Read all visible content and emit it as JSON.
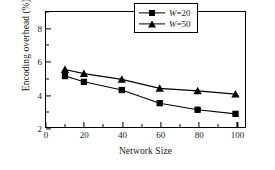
{
  "chart_data": {
    "type": "line",
    "title": "",
    "xlabel": "Network Size",
    "ylabel": "Encoding overhead (%)",
    "xlim": [
      0,
      105
    ],
    "ylim": [
      2,
      9
    ],
    "xticks": [
      0,
      20,
      40,
      60,
      80,
      100
    ],
    "xtick_labels": [
      "0",
      "20",
      "40",
      "60",
      "80",
      "100"
    ],
    "xticks_minor": [
      10,
      30,
      50,
      70,
      90
    ],
    "yticks": [
      2,
      4,
      6,
      8
    ],
    "ytick_labels": [
      "2",
      "4",
      "6",
      "8"
    ],
    "yticks_minor": [
      3,
      5,
      7,
      9
    ],
    "grid": false,
    "legend_position": "top-right",
    "x": [
      10,
      20,
      40,
      60,
      80,
      100
    ],
    "series": [
      {
        "name": "W=20",
        "marker": "square",
        "color": "#000000",
        "values": [
          5.1,
          4.75,
          4.25,
          3.45,
          3.05,
          2.8
        ]
      },
      {
        "name": "W=50",
        "marker": "triangle",
        "color": "#000000",
        "values": [
          5.5,
          5.25,
          4.9,
          4.35,
          4.2,
          4.0
        ]
      }
    ]
  },
  "legend": {
    "items": [
      {
        "var": "W",
        "eq": "=20",
        "label": "W=20"
      },
      {
        "var": "W",
        "eq": "=50",
        "label": "W=50"
      }
    ]
  }
}
